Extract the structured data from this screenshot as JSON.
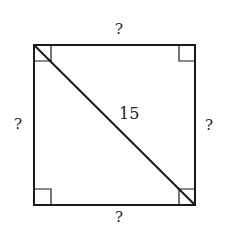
{
  "diagram": {
    "shape": "square",
    "labels": {
      "top": "?",
      "left": "?",
      "right": "?",
      "bottom": "?",
      "diagonal": "15"
    },
    "right_angle_markers": [
      "top-left",
      "top-right",
      "bottom-left",
      "bottom-right"
    ],
    "diagonal": "top-left to bottom-right",
    "colors": {
      "stroke": "#1a1a1a",
      "background": "#ffffff"
    }
  }
}
